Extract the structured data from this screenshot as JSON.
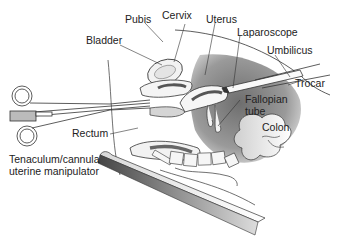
{
  "figure": {
    "type": "medical-illustration",
    "labels": {
      "pubis": "Pubis",
      "cervix": "Cervix",
      "uterus": "Uterus",
      "bladder": "Bladder",
      "laparoscope": "Laparoscope",
      "umbilicus": "Umbilicus",
      "trocar": "Trocar",
      "fallopian_tube_1": "Fallopian",
      "fallopian_tube_2": "tube",
      "colon": "Colon",
      "rectum": "Rectum",
      "manipulator_1": "Tenaculum/cannula",
      "manipulator_2": "uterine manipulator"
    },
    "colors": {
      "line": "#333333",
      "cavity_dark": "#7a7a7a",
      "cavity_light": "#e6e6e6",
      "organ_dark": "#5a5a5a",
      "table_dark": "#555555",
      "table_light": "#e8e8e8"
    }
  }
}
